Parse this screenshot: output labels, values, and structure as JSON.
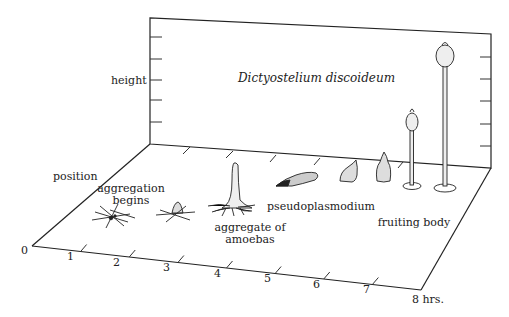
{
  "title": "Dictyostelium discoideum",
  "axes": {
    "vertical_label": "height",
    "depth_label": "position",
    "time_axis": {
      "ticks": [
        "0",
        "1",
        "2",
        "3",
        "4",
        "5",
        "6",
        "7",
        "8 hrs."
      ],
      "unit": "hrs."
    }
  },
  "stages": [
    {
      "label_line1": "aggregation",
      "label_line2": "begins"
    },
    {
      "label_line1": "aggregate of",
      "label_line2": "amoebas"
    },
    {
      "label_line1": "pseudoplasmodium",
      "label_line2": ""
    },
    {
      "label_line1": "fruiting body",
      "label_line2": ""
    }
  ],
  "colors": {
    "ink": "#222222",
    "background": "#ffffff"
  }
}
